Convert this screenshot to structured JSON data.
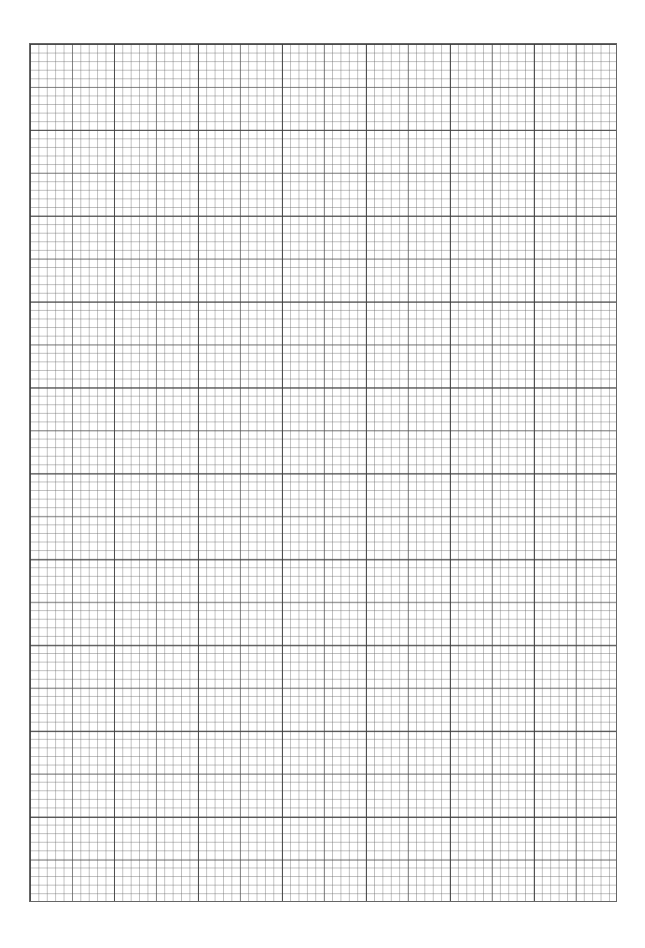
{
  "page": {
    "type": "graph-paper",
    "line_color": "#555555",
    "background_color": "#ffffff"
  }
}
